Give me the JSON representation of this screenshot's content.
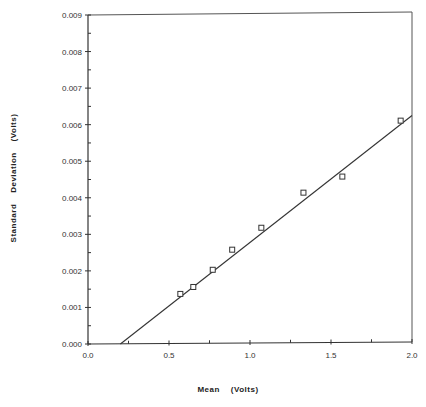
{
  "chart_data": {
    "type": "scatter",
    "title": "",
    "xlabel": "Mean    (Volts)",
    "ylabel": "Standard    Deviation    (Volts)",
    "xlim": [
      0.0,
      2.0
    ],
    "ylim": [
      0.0,
      0.009
    ],
    "x_ticks": [
      "0.0",
      "0.5",
      "1.0",
      "1.5",
      "2.0"
    ],
    "y_ticks": [
      "0.000",
      "0.001",
      "0.002",
      "0.003",
      "0.004",
      "0.005",
      "0.006",
      "0.007",
      "0.008",
      "0.009"
    ],
    "grid": false,
    "legend": null,
    "series": [
      {
        "name": "Measured",
        "marker": "square",
        "x": [
          0.57,
          0.65,
          0.77,
          0.89,
          1.07,
          1.33,
          1.57,
          1.93
        ],
        "y": [
          0.00137,
          0.00156,
          0.00203,
          0.00258,
          0.00318,
          0.00414,
          0.00458,
          0.00611
        ]
      },
      {
        "name": "Linear fit",
        "style": "line",
        "x": [
          0.2,
          2.0
        ],
        "y": [
          0.0,
          0.00625
        ]
      }
    ]
  }
}
